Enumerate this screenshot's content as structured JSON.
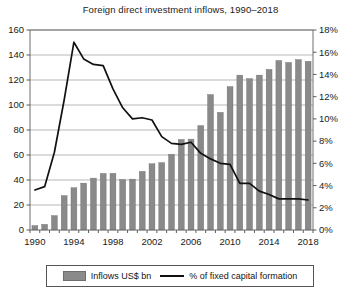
{
  "chart_data": {
    "type": "bar",
    "title": "Foreign direct investment inflows, 1990–2018",
    "xlabel": "",
    "ylabel": "",
    "grid": true,
    "legend_position": "bottom",
    "categories": [
      "1990",
      "1991",
      "1992",
      "1993",
      "1994",
      "1995",
      "1996",
      "1997",
      "1998",
      "1999",
      "2000",
      "2001",
      "2002",
      "2003",
      "2004",
      "2005",
      "2006",
      "2007",
      "2008",
      "2009",
      "2010",
      "2011",
      "2012",
      "2013",
      "2014",
      "2015",
      "2016",
      "2017",
      "2018"
    ],
    "x_tick_labels": [
      "1990",
      "1994",
      "1998",
      "2002",
      "2006",
      "2010",
      "2014",
      "2018"
    ],
    "left_axis": {
      "label": "Inflows US$ bn",
      "ylim": [
        0,
        160
      ],
      "ticks": [
        0,
        20,
        40,
        60,
        80,
        100,
        120,
        140,
        160
      ],
      "tick_labels": [
        "0",
        "20",
        "40",
        "60",
        "80",
        "100",
        "120",
        "140",
        "160"
      ]
    },
    "right_axis": {
      "label": "% of fixed capital formation",
      "ylim": [
        0,
        18
      ],
      "ticks": [
        0,
        2,
        4,
        6,
        8,
        10,
        12,
        14,
        16,
        18
      ],
      "tick_labels": [
        "0%",
        "2%",
        "4%",
        "6%",
        "8%",
        "10%",
        "12%",
        "14%",
        "16%",
        "18%"
      ]
    },
    "series": [
      {
        "name": "Inflows US$ bn",
        "type": "bar",
        "axis": "left",
        "color": "#8a8a8a",
        "values": [
          3.5,
          4.5,
          11.5,
          27.5,
          33.8,
          37.5,
          41.5,
          45.2,
          45.3,
          40.4,
          40.7,
          46.9,
          53.0,
          53.9,
          60.6,
          72.4,
          72.7,
          83.5,
          108.3,
          94.1,
          114.7,
          123.9,
          121.1,
          123.9,
          128.5,
          135.6,
          134.0,
          136.3,
          134.9
        ]
      },
      {
        "name": "% of fixed capital formation",
        "type": "line",
        "axis": "right",
        "color": "#111111",
        "values": [
          3.6,
          3.9,
          7.0,
          11.7,
          16.9,
          15.4,
          14.9,
          14.8,
          12.7,
          11.0,
          10.0,
          10.1,
          9.9,
          8.4,
          7.8,
          7.7,
          7.9,
          6.9,
          6.4,
          6.0,
          5.9,
          4.2,
          4.2,
          3.5,
          3.2,
          2.8,
          2.8,
          2.8,
          2.7
        ]
      }
    ]
  },
  "legend": {
    "bar_label": "Inflows US$ bn",
    "line_label": "% of fixed capital formation"
  }
}
